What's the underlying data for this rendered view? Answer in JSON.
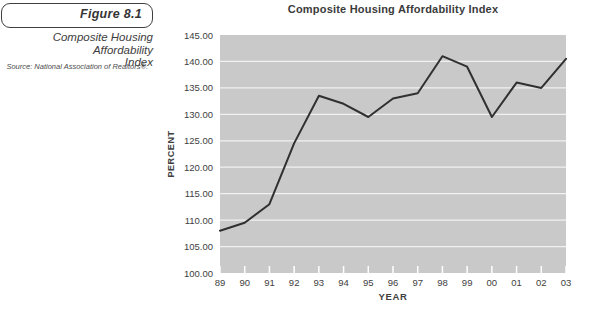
{
  "figure": {
    "label": "Figure 8.1",
    "caption_line1": "Composite Housing Affordability",
    "caption_line2": "Index",
    "source": "Source: National Association of Realtors®."
  },
  "chart": {
    "title": "Composite Housing Affordability Index",
    "xlabel": "YEAR",
    "ylabel": "PERCENT"
  },
  "chart_data": {
    "type": "line",
    "title": "Composite Housing Affordability Index",
    "xlabel": "YEAR",
    "ylabel": "PERCENT",
    "categories": [
      "89",
      "90",
      "91",
      "92",
      "93",
      "94",
      "95",
      "96",
      "97",
      "98",
      "99",
      "00",
      "01",
      "02",
      "03"
    ],
    "values": [
      108,
      109.5,
      113,
      124.5,
      133.5,
      132,
      129.5,
      133,
      134,
      141,
      139,
      129.5,
      136,
      135,
      140.5
    ],
    "ylim": [
      100,
      145
    ],
    "ytick_step": 5,
    "ytick_labels": [
      "145.00",
      "140.00",
      "135.00",
      "130.00",
      "125.00",
      "120.00",
      "115.00",
      "110.00",
      "105.00",
      "100.00"
    ],
    "grid": "horizontal-white-gridlines",
    "legend": "none"
  },
  "colors": {
    "plot_bg": "#c9c9c9",
    "gridline": "#f1f1f1",
    "line": "#303030",
    "tick": "#ffffff",
    "text": "#414141"
  }
}
